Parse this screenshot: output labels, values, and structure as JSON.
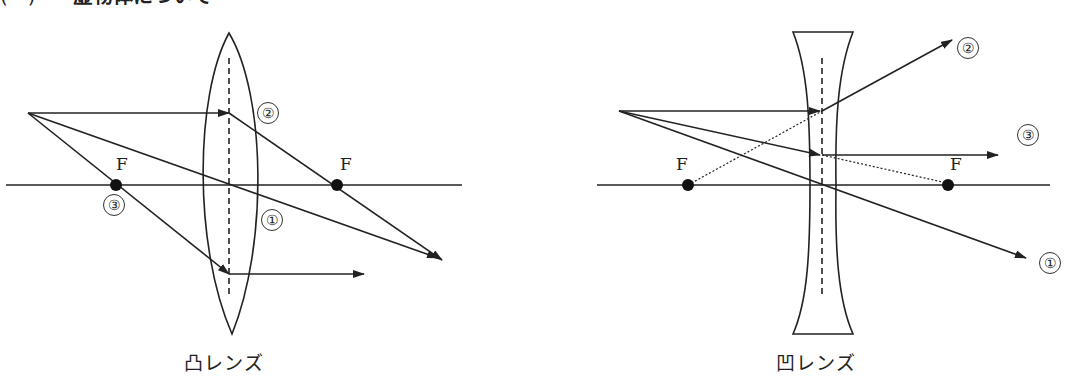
{
  "heading": {
    "number": "(　)",
    "text": "虚物体について"
  },
  "diagrams": [
    {
      "id": "convex",
      "caption": "凸レンズ",
      "focal_label": "F",
      "rays": [
        {
          "marker": "①",
          "description": "ray through lens center, continues straight"
        },
        {
          "marker": "②",
          "description": "parallel ray refracted through far focal point F"
        },
        {
          "marker": "③",
          "description": "ray through near focal point F, exits parallel"
        }
      ]
    },
    {
      "id": "concave",
      "caption": "凹レンズ",
      "focal_label": "F",
      "rays": [
        {
          "marker": "①",
          "description": "ray through lens center, continues straight"
        },
        {
          "marker": "②",
          "description": "parallel ray diverges as if from near focal point F"
        },
        {
          "marker": "③",
          "description": "ray aimed at far focal point F, exits parallel"
        }
      ]
    }
  ],
  "colors": {
    "line": "#222222",
    "background": "#ffffff"
  }
}
